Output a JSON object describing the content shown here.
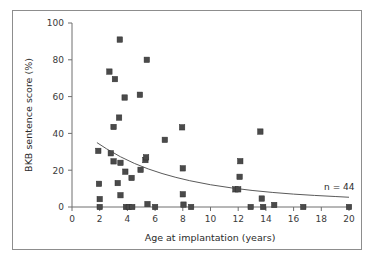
{
  "figure": {
    "background": "#ffffff",
    "border_color": "#8d8d8d",
    "marker_color": "#4a4a4a",
    "axis_color": "#6f6f6f",
    "trend_color": "#5a5a5a"
  },
  "chart_data": {
    "type": "scatter",
    "title": "",
    "xlabel": "Age at implantation (years)",
    "ylabel": "BKB sentence score (%)",
    "xlim": [
      0,
      20
    ],
    "ylim": [
      0,
      100
    ],
    "xticks": [
      0,
      2,
      4,
      6,
      8,
      10,
      12,
      14,
      16,
      18,
      20
    ],
    "xticklabels": [
      "0",
      "2",
      "4",
      "6",
      "8",
      "10",
      "12",
      "14",
      "16",
      "18",
      "20"
    ],
    "yticks": [
      0,
      20,
      40,
      60,
      80,
      100
    ],
    "yticklabels": [
      "0",
      "20",
      "40",
      "60",
      "80",
      "100"
    ],
    "grid": false,
    "legend": null,
    "annotations": [
      {
        "text": "n = 44",
        "x": 18.2,
        "y": 9.5
      }
    ],
    "series": [
      {
        "name": "Individual subjects",
        "marker": "square",
        "color": "#4a4a4a",
        "points": [
          [
            1.9,
            30.5
          ],
          [
            1.95,
            12.6
          ],
          [
            2.0,
            4.3
          ],
          [
            2.0,
            0.0
          ],
          [
            2.7,
            73.6
          ],
          [
            2.8,
            29.2
          ],
          [
            3.0,
            43.5
          ],
          [
            3.0,
            24.8
          ],
          [
            3.1,
            69.5
          ],
          [
            3.3,
            13.0
          ],
          [
            3.4,
            48.6
          ],
          [
            3.45,
            91.0
          ],
          [
            3.5,
            24.0
          ],
          [
            3.5,
            6.4
          ],
          [
            3.8,
            59.5
          ],
          [
            3.85,
            19.2
          ],
          [
            3.9,
            0.0
          ],
          [
            4.1,
            0.0
          ],
          [
            4.3,
            15.8
          ],
          [
            4.35,
            0.0
          ],
          [
            4.9,
            61.0
          ],
          [
            4.95,
            20.2
          ],
          [
            5.3,
            25.5
          ],
          [
            5.35,
            27.0
          ],
          [
            5.4,
            80.0
          ],
          [
            5.45,
            1.6
          ],
          [
            6.0,
            0.0
          ],
          [
            6.7,
            36.5
          ],
          [
            7.95,
            43.3
          ],
          [
            8.0,
            21.0
          ],
          [
            8.0,
            6.9
          ],
          [
            8.05,
            1.3
          ],
          [
            8.6,
            0.0
          ],
          [
            11.8,
            9.6
          ],
          [
            12.0,
            9.6
          ],
          [
            12.1,
            16.4
          ],
          [
            12.15,
            24.9
          ],
          [
            12.9,
            0.0
          ],
          [
            13.6,
            41.0
          ],
          [
            13.7,
            4.6
          ],
          [
            13.8,
            0.0
          ],
          [
            14.6,
            1.1
          ],
          [
            16.7,
            0.0
          ],
          [
            20.0,
            0.0
          ]
        ]
      }
    ],
    "trend": {
      "name": "Exponential decay fit",
      "type": "exponential",
      "color": "#5a5a5a",
      "points": [
        [
          1.8,
          35.0
        ],
        [
          2.5,
          31.6
        ],
        [
          3.5,
          27.3
        ],
        [
          4.5,
          23.7
        ],
        [
          5.5,
          20.7
        ],
        [
          6.5,
          18.2
        ],
        [
          7.5,
          16.1
        ],
        [
          8.5,
          14.3
        ],
        [
          10.0,
          12.1
        ],
        [
          11.5,
          10.4
        ],
        [
          13.0,
          9.0
        ],
        [
          14.5,
          7.9
        ],
        [
          16.0,
          7.0
        ],
        [
          17.5,
          6.3
        ],
        [
          19.0,
          5.7
        ],
        [
          20.0,
          5.3
        ]
      ]
    }
  }
}
